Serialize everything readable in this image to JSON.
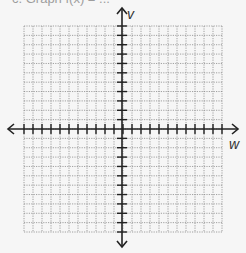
{
  "caption": "c. Graph f(x) = ...",
  "chart_data": {
    "type": "scatter",
    "title": "",
    "xlabel": "w",
    "ylabel": "v",
    "grid": true,
    "grid_cells": {
      "columns": 22,
      "rows": 22
    },
    "xlim": [
      -11,
      11
    ],
    "ylim": [
      -11,
      11
    ],
    "tick_labels": {
      "x": [],
      "y": []
    },
    "series": [],
    "legend": null
  },
  "colors": {
    "axis": "#222222",
    "grid": "#8a8a8a",
    "background": "#f6f6f6"
  }
}
